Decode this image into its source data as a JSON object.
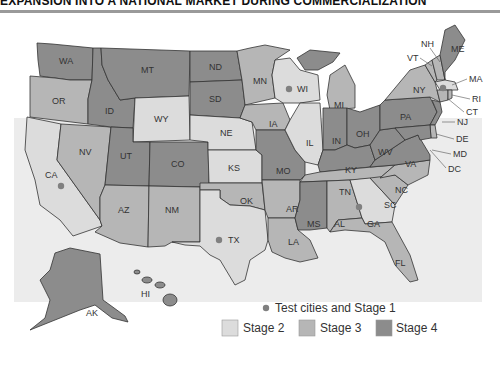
{
  "title": "EXPANSION INTO A NATIONAL MARKET DURING COMMERCIALIZATION",
  "colors": {
    "stage2": "#dcdcdc",
    "stage3": "#b6b6b6",
    "stage4": "#8c8c8c",
    "test_city_dot": "#808080",
    "background": "#ececec",
    "border": "#333333"
  },
  "legend": {
    "test_cities": "Test cities and Stage 1",
    "stage2": "Stage 2",
    "stage3": "Stage 3",
    "stage4": "Stage 4"
  },
  "states": {
    "WA": {
      "label": "WA",
      "stage": 4
    },
    "OR": {
      "label": "OR",
      "stage": 3
    },
    "CA": {
      "label": "CA",
      "stage": 2,
      "test_city": true
    },
    "NV": {
      "label": "NV",
      "stage": 3
    },
    "ID": {
      "label": "ID",
      "stage": 4
    },
    "MT": {
      "label": "MT",
      "stage": 4
    },
    "WY": {
      "label": "WY",
      "stage": 2
    },
    "UT": {
      "label": "UT",
      "stage": 4
    },
    "CO": {
      "label": "CO",
      "stage": 4
    },
    "AZ": {
      "label": "AZ",
      "stage": 3
    },
    "NM": {
      "label": "NM",
      "stage": 3
    },
    "ND": {
      "label": "ND",
      "stage": 4
    },
    "SD": {
      "label": "SD",
      "stage": 4
    },
    "NE": {
      "label": "NE",
      "stage": 3
    },
    "KS": {
      "label": "KS",
      "stage": 3
    },
    "OK": {
      "label": "OK",
      "stage": 3
    },
    "TX": {
      "label": "TX",
      "stage": 2,
      "test_city": true
    },
    "MN": {
      "label": "MN",
      "stage": 3
    },
    "IA": {
      "label": "IA",
      "stage": 3
    },
    "MO": {
      "label": "MO",
      "stage": 4
    },
    "AR": {
      "label": "AR",
      "stage": 3
    },
    "LA": {
      "label": "LA",
      "stage": 3
    },
    "WI": {
      "label": "WI",
      "stage": 2,
      "test_city": true
    },
    "IL": {
      "label": "IL",
      "stage": 2
    },
    "MI": {
      "label": "MI",
      "stage": 3
    },
    "IN": {
      "label": "IN",
      "stage": 4
    },
    "OH": {
      "label": "OH",
      "stage": 4
    },
    "KY": {
      "label": "KY",
      "stage": 4
    },
    "TN": {
      "label": "TN",
      "stage": 3
    },
    "MS": {
      "label": "MS",
      "stage": 4
    },
    "AL": {
      "label": "AL",
      "stage": 3
    },
    "GA": {
      "label": "GA",
      "stage": 2,
      "test_city": true
    },
    "FL": {
      "label": "FL",
      "stage": 3
    },
    "SC": {
      "label": "SC",
      "stage": 3
    },
    "NC": {
      "label": "NC",
      "stage": 3
    },
    "VA": {
      "label": "VA",
      "stage": 4
    },
    "WV": {
      "label": "WV",
      "stage": 4
    },
    "PA": {
      "label": "PA",
      "stage": 4
    },
    "NY": {
      "label": "NY",
      "stage": 3
    },
    "VT": {
      "label": "VT",
      "stage": 3
    },
    "NH": {
      "label": "NH",
      "stage": 3
    },
    "ME": {
      "label": "ME",
      "stage": 4
    },
    "MA": {
      "label": "MA",
      "stage": 2,
      "test_city": true
    },
    "RI": {
      "label": "RI",
      "stage": 3
    },
    "CT": {
      "label": "CT",
      "stage": 3
    },
    "NJ": {
      "label": "NJ",
      "stage": 4
    },
    "DE": {
      "label": "DE",
      "stage": 3
    },
    "MD": {
      "label": "MD",
      "stage": 4
    },
    "DC": {
      "label": "DC",
      "stage": 4
    },
    "AK": {
      "label": "AK",
      "stage": 4
    },
    "HI": {
      "label": "HI",
      "stage": 4
    }
  }
}
